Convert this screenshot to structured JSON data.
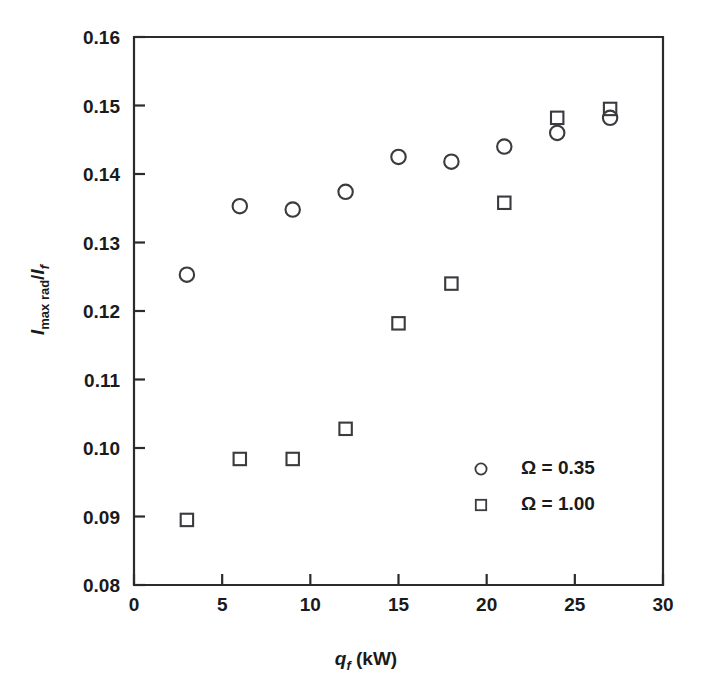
{
  "chart_data": {
    "type": "scatter",
    "title": "",
    "xlabel": "q_f (kW)",
    "ylabel": "I_max rad / I_f",
    "xlabel_parts": {
      "symbol": "q",
      "subscript": "f",
      "units": "(kW)"
    },
    "ylabel_parts": {
      "symbol1": "I",
      "subscript1": "max rad",
      "separator": "/",
      "symbol2": "I",
      "subscript2": "f"
    },
    "xlim": [
      0,
      30
    ],
    "ylim": [
      0.08,
      0.16
    ],
    "xticks": [
      0,
      5,
      10,
      15,
      20,
      25,
      30
    ],
    "yticks": [
      0.08,
      0.09,
      0.1,
      0.11,
      0.12,
      0.13,
      0.14,
      0.15,
      0.16
    ],
    "xtick_labels": [
      "0",
      "5",
      "10",
      "15",
      "20",
      "25",
      "30"
    ],
    "ytick_labels": [
      "0.08",
      "0.09",
      "0.10",
      "0.11",
      "0.12",
      "0.13",
      "0.14",
      "0.15",
      "0.16"
    ],
    "grid": false,
    "legend_position": "lower right",
    "series": [
      {
        "name": "Ω = 0.35",
        "marker": "circle",
        "color": "#3a3a3f",
        "x": [
          3,
          6,
          9,
          12,
          15,
          18,
          21,
          24,
          27
        ],
        "y": [
          0.1253,
          0.1353,
          0.1348,
          0.1374,
          0.1425,
          0.1418,
          0.144,
          0.146,
          0.1482
        ]
      },
      {
        "name": "Ω = 1.00",
        "marker": "square",
        "color": "#3a3a3f",
        "x": [
          3,
          6,
          9,
          12,
          15,
          18,
          21,
          24,
          27
        ],
        "y": [
          0.0895,
          0.0984,
          0.0984,
          0.1028,
          0.1182,
          0.124,
          0.1358,
          0.1482,
          0.1495
        ]
      }
    ]
  },
  "legend": {
    "entries": [
      {
        "label": "Ω = 0.35",
        "marker": "circle"
      },
      {
        "label": "Ω = 1.00",
        "marker": "square"
      }
    ]
  }
}
